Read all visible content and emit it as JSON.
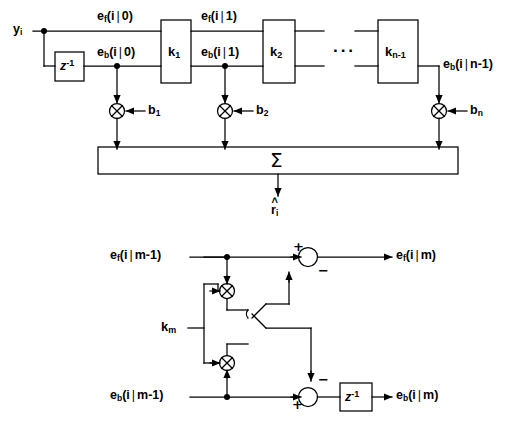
{
  "figure": {
    "stroke_color": "#000000",
    "background_color": "#ffffff"
  },
  "top_diagram": {
    "name": "tapped-lattice-predictor",
    "input_label": {
      "base": "y",
      "sub": "i"
    },
    "delay_block_label": {
      "base": "z",
      "sup": "-1"
    },
    "forward_signals": [
      {
        "name": "e_f_i_0",
        "base": "e",
        "sub": "f",
        "arg_left": "(i",
        "arg_right": "0)"
      },
      {
        "name": "e_f_i_1",
        "base": "e",
        "sub": "f",
        "arg_left": "(i",
        "arg_right": "1)"
      }
    ],
    "backward_signals": [
      {
        "name": "e_b_i_0",
        "base": "e",
        "sub": "b",
        "arg_left": "(i",
        "arg_right": "0)"
      },
      {
        "name": "e_b_i_1",
        "base": "e",
        "sub": "b",
        "arg_left": "(i",
        "arg_right": "1)"
      },
      {
        "name": "e_b_i_n_minus_1",
        "base": "e",
        "sub": "b",
        "arg_left": "(i",
        "arg_right": "n-1)"
      }
    ],
    "stages": [
      {
        "name": "stage-k1",
        "base": "k",
        "sub": "1"
      },
      {
        "name": "stage-k2",
        "base": "k",
        "sub": "2"
      },
      {
        "name": "stage-kn-1",
        "base": "k",
        "sub": "n-1"
      }
    ],
    "ellipsis": "···",
    "tap_gains": [
      {
        "name": "tap-b1",
        "base": "b",
        "sub": "1"
      },
      {
        "name": "tap-b2",
        "base": "b",
        "sub": "2"
      },
      {
        "name": "tap-bn",
        "base": "b",
        "sub": "n"
      }
    ],
    "summer_label": "Σ",
    "output_label": {
      "hat": "˄",
      "base": "r",
      "sub": "i"
    }
  },
  "bottom_diagram": {
    "name": "single-lattice-stage",
    "inputs": [
      {
        "name": "e_f_i_m_minus_1",
        "base": "e",
        "sub": "f",
        "arg_left": "(i",
        "arg_right": "m-1)"
      },
      {
        "name": "e_b_i_m_minus_1",
        "base": "e",
        "sub": "b",
        "arg_left": "(i",
        "arg_right": "m-1)"
      }
    ],
    "outputs": [
      {
        "name": "e_f_i_m",
        "base": "e",
        "sub": "f",
        "arg_left": "(i",
        "arg_right": "m)"
      },
      {
        "name": "e_b_i_m",
        "base": "e",
        "sub": "b",
        "arg_left": "(i",
        "arg_right": "m)"
      }
    ],
    "coefficient_label": {
      "base": "k",
      "sub": "m"
    },
    "delay_block_label": {
      "base": "z",
      "sup": "-1"
    },
    "adder_signs": {
      "forward_plus": "+",
      "forward_minus": "−",
      "backward_plus": "+",
      "backward_minus": "−"
    },
    "multiplier_symbol": "⊗"
  }
}
